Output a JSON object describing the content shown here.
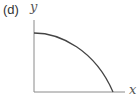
{
  "panel": {
    "label": "(d)"
  },
  "axes": {
    "x_label": "x",
    "y_label": "y"
  },
  "colors": {
    "axis": "#8a8a8a",
    "curve": "#444444"
  },
  "curve": {
    "description": "Concave-down decreasing curve starting horizontal at the y-axis and meeting the x-axis",
    "path": "M34,33 C60,33 95,50 113,92"
  }
}
